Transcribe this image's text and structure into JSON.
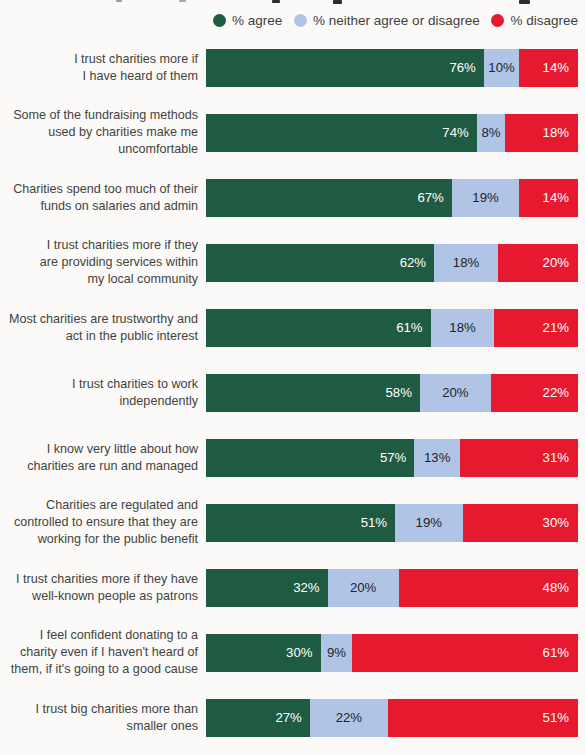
{
  "page": {
    "background": "#fbfaf8"
  },
  "legend": {
    "items": [
      {
        "label": "% agree",
        "color": "#1f5b42"
      },
      {
        "label": "% neither agree or disagree",
        "color": "#b0c4e6"
      },
      {
        "label": "% disagree",
        "color": "#e6192e"
      }
    ]
  },
  "chart_data": {
    "type": "bar",
    "orientation": "horizontal",
    "stacked": true,
    "unit": "%",
    "xlim": [
      0,
      100
    ],
    "grid": false,
    "legend_position": "top",
    "value_labels": "inside",
    "categories": [
      "I trust charities more if I have heard of them",
      "Some of the fundraising methods used by charities make me uncomfortable",
      "Charities spend too much of their funds on salaries and admin",
      "I trust charities more if they are providing services within my local community",
      "Most charities are trustworthy and act in the public interest",
      "I trust charities to work independently",
      "I know very little about how charities are run and managed",
      "Charities are regulated and controlled to ensure that they are working for the public benefit",
      "I trust charities more if they have well-known people as patrons",
      "I feel confident donating to a charity even if I haven't heard of them, if it's going to a good cause",
      "I trust big charities more than smaller ones"
    ],
    "series": [
      {
        "name": "% agree",
        "color": "#1f5b42",
        "text_color": "#ffffff",
        "values": [
          76,
          74,
          67,
          62,
          61,
          58,
          57,
          51,
          32,
          30,
          27
        ]
      },
      {
        "name": "% neither agree or disagree",
        "color": "#b0c4e6",
        "text_color": "#20242c",
        "values": [
          10,
          8,
          19,
          18,
          18,
          20,
          13,
          19,
          20,
          9,
          22
        ]
      },
      {
        "name": "% disagree",
        "color": "#e6192e",
        "text_color": "#ffffff",
        "values": [
          14,
          18,
          14,
          20,
          21,
          22,
          31,
          30,
          48,
          61,
          51
        ]
      }
    ]
  },
  "rows": [
    {
      "label_lines": [
        "I trust charities more if",
        "I have heard of them"
      ]
    },
    {
      "label_lines": [
        "Some of the fundraising methods",
        "used by charities make me",
        "uncomfortable"
      ]
    },
    {
      "label_lines": [
        "Charities spend too much of their",
        "funds on salaries and admin"
      ]
    },
    {
      "label_lines": [
        "I trust charities more if they",
        "are providing services within",
        "my local community"
      ]
    },
    {
      "label_lines": [
        "Most charities are trustworthy and",
        "act in the public interest"
      ]
    },
    {
      "label_lines": [
        "I trust charities to work",
        "independently"
      ]
    },
    {
      "label_lines": [
        "I know very little about how",
        "charities are run and managed"
      ]
    },
    {
      "label_lines": [
        "Charities are regulated and",
        "controlled to ensure that they are",
        "working for the public benefit"
      ]
    },
    {
      "label_lines": [
        "I trust charities more if they have",
        "well-known people as patrons"
      ]
    },
    {
      "label_lines": [
        "I feel confident donating to a",
        "charity even if I haven't heard of",
        "them, if it's going to a good cause"
      ]
    },
    {
      "label_lines": [
        "I trust big charities more than",
        "smaller ones"
      ]
    }
  ]
}
